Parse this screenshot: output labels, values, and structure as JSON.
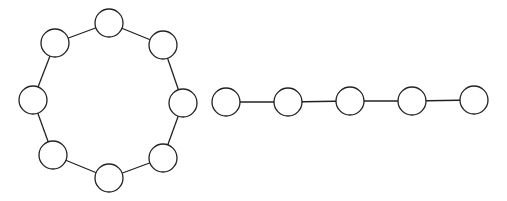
{
  "diagram": {
    "type": "graph",
    "components": [
      {
        "name": "cycle-graph",
        "node_count": 8,
        "node_radius": 14,
        "nodes": [
          {
            "id": "c1",
            "x": 109,
            "y": 23
          },
          {
            "id": "c2",
            "x": 163,
            "y": 45
          },
          {
            "id": "c3",
            "x": 183,
            "y": 103
          },
          {
            "id": "c4",
            "x": 163,
            "y": 158
          },
          {
            "id": "c5",
            "x": 109,
            "y": 178
          },
          {
            "id": "c6",
            "x": 53,
            "y": 155
          },
          {
            "id": "c7",
            "x": 33,
            "y": 100
          },
          {
            "id": "c8",
            "x": 55,
            "y": 43
          }
        ],
        "edges": [
          [
            "c1",
            "c2"
          ],
          [
            "c2",
            "c3"
          ],
          [
            "c3",
            "c4"
          ],
          [
            "c4",
            "c5"
          ],
          [
            "c5",
            "c6"
          ],
          [
            "c6",
            "c7"
          ],
          [
            "c7",
            "c8"
          ],
          [
            "c8",
            "c1"
          ]
        ]
      },
      {
        "name": "path-graph",
        "node_count": 5,
        "node_radius": 14,
        "nodes": [
          {
            "id": "p1",
            "x": 226,
            "y": 102
          },
          {
            "id": "p2",
            "x": 288,
            "y": 102
          },
          {
            "id": "p3",
            "x": 350,
            "y": 101
          },
          {
            "id": "p4",
            "x": 412,
            "y": 101
          },
          {
            "id": "p5",
            "x": 474,
            "y": 100
          }
        ],
        "edges": [
          [
            "p1",
            "p2"
          ],
          [
            "p2",
            "p3"
          ],
          [
            "p3",
            "p4"
          ],
          [
            "p4",
            "p5"
          ]
        ]
      }
    ],
    "colors": {
      "stroke": "#222222",
      "fill": "#ffffff",
      "background": "#ffffff"
    }
  }
}
